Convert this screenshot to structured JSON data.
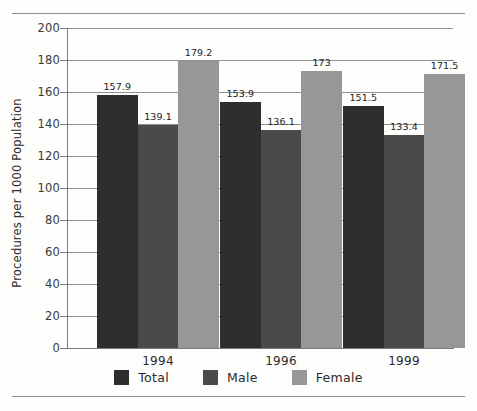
{
  "chart_data": {
    "type": "bar",
    "title": "",
    "subtitle": "",
    "xlabel": "",
    "ylabel": "Procedures per 1000 Population",
    "categories": [
      "1994",
      "1996",
      "1999"
    ],
    "series": [
      {
        "name": "Total",
        "color": "#2e2e2e",
        "values": [
          157.9,
          153.9,
          151.5
        ],
        "labels": [
          "157.9",
          "153.9",
          "151.5"
        ]
      },
      {
        "name": "Male",
        "color": "#4a4a4a",
        "values": [
          139.1,
          136.1,
          133.4
        ],
        "labels": [
          "139.1",
          "136.1",
          "133.4"
        ]
      },
      {
        "name": "Female",
        "color": "#979797",
        "values": [
          179.2,
          173.0,
          171.5
        ],
        "labels": [
          "179.2",
          "173",
          "171.5"
        ]
      }
    ],
    "ylim": [
      0,
      200
    ],
    "yticks": [
      0,
      20,
      40,
      60,
      80,
      100,
      120,
      140,
      160,
      180,
      200
    ],
    "ytick_labels": [
      "0",
      "20",
      "40",
      "60",
      "80",
      "100",
      "120",
      "140",
      "160",
      "180",
      "200"
    ],
    "grid": true,
    "grid_axis": "y",
    "legend_position": "bottom",
    "bar_value_labels": true
  },
  "legend": {
    "items": [
      {
        "label": "Total",
        "color": "#2e2e2e"
      },
      {
        "label": "Male",
        "color": "#4a4a4a"
      },
      {
        "label": "Female",
        "color": "#979797"
      }
    ]
  },
  "axes": {
    "y_title": "Procedures per 1000 Population",
    "x_categories": [
      "1994",
      "1996",
      "1999"
    ]
  }
}
